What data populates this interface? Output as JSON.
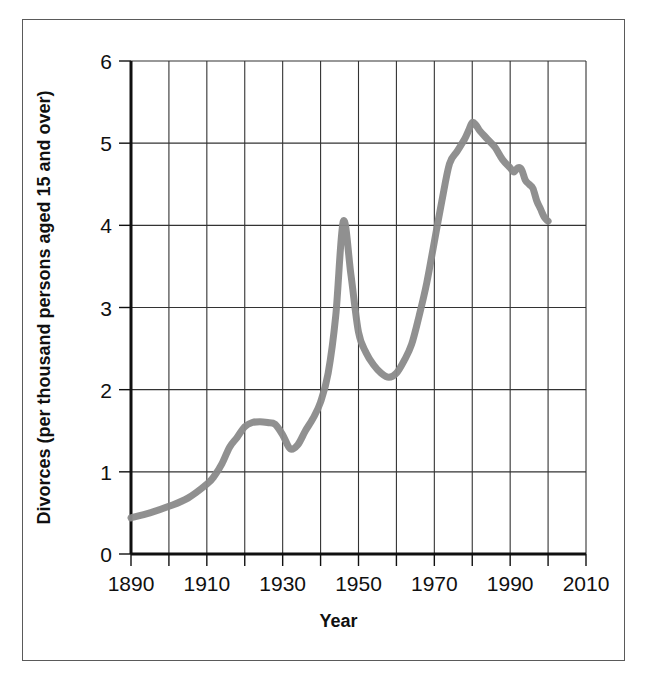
{
  "chart_data": {
    "type": "line",
    "title": "",
    "subtitle": "",
    "xlabel": "Year",
    "ylabel": "Divorces (per thousand persons aged 15 and over)",
    "xlim": [
      1890,
      2010
    ],
    "ylim": [
      0,
      6
    ],
    "x_tick_labels": [
      "1890",
      "1910",
      "1930",
      "1950",
      "1970",
      "1990",
      "2010"
    ],
    "x_tick_values": [
      1890,
      1910,
      1930,
      1950,
      1970,
      1990,
      2010
    ],
    "x_gridline_values": [
      1890,
      1900,
      1910,
      1920,
      1930,
      1940,
      1950,
      1960,
      1970,
      1980,
      1990,
      2000,
      2010
    ],
    "y_tick_labels": [
      "0",
      "1",
      "2",
      "3",
      "4",
      "5",
      "6"
    ],
    "y_tick_values": [
      0,
      1,
      2,
      3,
      4,
      5,
      6
    ],
    "grid": true,
    "legend": false,
    "legend_position": "none",
    "line_color": "#8a8a8a",
    "line_width_px": 7,
    "axis_color": "#101010",
    "grid_color": "#333333",
    "series": [
      {
        "name": "Divorce rate",
        "x": [
          1890,
          1895,
          1900,
          1905,
          1910,
          1912,
          1914,
          1916,
          1918,
          1920,
          1922,
          1924,
          1926,
          1928,
          1930,
          1932,
          1934,
          1936,
          1938,
          1940,
          1942,
          1944,
          1946,
          1948,
          1950,
          1952,
          1954,
          1956,
          1958,
          1960,
          1962,
          1964,
          1966,
          1968,
          1970,
          1972,
          1974,
          1976,
          1978,
          1979,
          1980,
          1981,
          1982,
          1984,
          1986,
          1988,
          1990,
          1991,
          1992,
          1993,
          1994,
          1995,
          1996,
          1997,
          1998,
          1999,
          2000
        ],
        "values": [
          0.44,
          0.5,
          0.58,
          0.68,
          0.85,
          0.95,
          1.1,
          1.3,
          1.42,
          1.55,
          1.6,
          1.61,
          1.6,
          1.58,
          1.45,
          1.28,
          1.33,
          1.5,
          1.65,
          1.85,
          2.2,
          2.9,
          4.05,
          3.4,
          2.7,
          2.45,
          2.3,
          2.2,
          2.15,
          2.2,
          2.35,
          2.55,
          2.9,
          3.3,
          3.8,
          4.3,
          4.75,
          4.9,
          5.05,
          5.15,
          5.25,
          5.22,
          5.15,
          5.05,
          4.95,
          4.8,
          4.7,
          4.65,
          4.7,
          4.68,
          4.55,
          4.5,
          4.45,
          4.3,
          4.2,
          4.1,
          4.05
        ]
      }
    ],
    "annotations": []
  },
  "figure": {
    "frame_visible": true,
    "background_color": "#ffffff"
  }
}
